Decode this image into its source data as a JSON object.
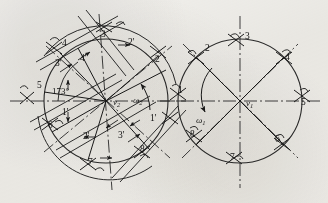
{
  "figure": {
    "kind": "kinematic-position-diagram",
    "background_color": "#f2f1ee",
    "ink_color": "#1b1b1b"
  },
  "left_circle": {
    "name": "circle-omega-2",
    "center_label": "v",
    "center_sub": "2",
    "angular_velocity_label": "ω",
    "angular_velocity_sub": "2",
    "angle_annotation": "173°",
    "radius": 62,
    "cx": 106,
    "cy": 101,
    "position_labels": [
      {
        "id": "p1p",
        "text": "1'",
        "x": 62,
        "y": 115
      },
      {
        "id": "p2p_upper",
        "text": "2'",
        "x": 128,
        "y": 45
      },
      {
        "id": "p2p_lower",
        "text": "2'",
        "x": 83,
        "y": 139
      },
      {
        "id": "p3",
        "text": "3",
        "x": 101,
        "y": 37
      },
      {
        "id": "p3p_upper",
        "text": "3'",
        "x": 55,
        "y": 66
      },
      {
        "id": "p3p_lower",
        "text": "3'",
        "x": 118,
        "y": 138
      },
      {
        "id": "p4",
        "text": "4",
        "x": 62,
        "y": 46
      },
      {
        "id": "p4p",
        "text": "4'",
        "x": 80,
        "y": 61
      },
      {
        "id": "p5",
        "text": "5",
        "x": 37,
        "y": 88
      },
      {
        "id": "p6",
        "text": "6",
        "x": 48,
        "y": 128
      },
      {
        "id": "p7",
        "text": "7",
        "x": 88,
        "y": 165
      },
      {
        "id": "p8",
        "text": "8",
        "x": 140,
        "y": 152
      },
      {
        "id": "p1p_right",
        "text": "1'",
        "x": 150,
        "y": 121
      },
      {
        "id": "p2_right",
        "text": "2",
        "x": 155,
        "y": 62
      }
    ]
  },
  "right_circle": {
    "name": "circle-omega-1",
    "center_label": "v",
    "center_sub": "1",
    "angular_velocity_label": "ω",
    "angular_velocity_sub": "1",
    "radius": 62,
    "cx": 240,
    "cy": 101,
    "position_labels": [
      {
        "id": "r1",
        "text": "1",
        "x": 178,
        "y": 93
      },
      {
        "id": "r2",
        "text": "2",
        "x": 205,
        "y": 51
      },
      {
        "id": "r3",
        "text": "3",
        "x": 245,
        "y": 39
      },
      {
        "id": "r4",
        "text": "4",
        "x": 285,
        "y": 60
      },
      {
        "id": "r5",
        "text": "5",
        "x": 301,
        "y": 105
      },
      {
        "id": "r6",
        "text": "6",
        "x": 275,
        "y": 142
      },
      {
        "id": "r7",
        "text": "7",
        "x": 230,
        "y": 160
      },
      {
        "id": "r8",
        "text": "8",
        "x": 190,
        "y": 137
      }
    ]
  }
}
